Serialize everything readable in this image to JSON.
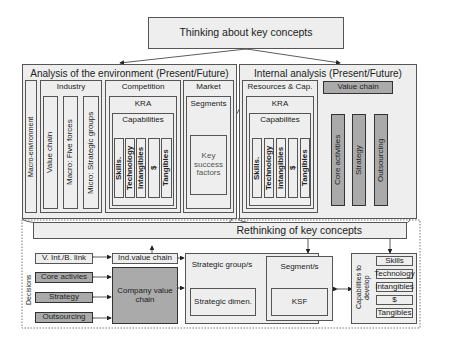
{
  "title": "Thinking about key concepts",
  "env": {
    "title": "Analysis of the environment (Present/Future)",
    "macro": "Macro-environment",
    "industry": "Industry",
    "industry_items": [
      "Value chain",
      "Macro: Five forces",
      "Micro: Strategic groups"
    ],
    "competition": "Competition",
    "kra": "KRA",
    "capabilities": "Capabilities",
    "cap_items": [
      "Skills.",
      "Technology",
      "Intangibles",
      "$",
      "Tangibles"
    ],
    "market": "Market",
    "segments": "Segments",
    "ksf": "Key success factors"
  },
  "internal": {
    "title": "Internal analysis (Present/Future)",
    "resources": "Resources & Cap.",
    "kra": "KRA",
    "capabilities": "Capabilites",
    "cap_items": [
      "Skills.",
      "Technology",
      "Intangibles",
      "$",
      "Tangibles"
    ],
    "value_chain": "Value chain",
    "vc_items": [
      "Core activities",
      "Strategy",
      "Outsourcing"
    ]
  },
  "rethink": {
    "title": "Rethinking of key concepts",
    "decisions": "Decisions",
    "left": [
      "V. Int./B. link",
      "Core activies",
      "Strategy",
      "Outsourcing"
    ],
    "ind_vc": "Ind.value chain",
    "company_vc": "Company value chain",
    "strategic_groups": "Strategic group/s",
    "strategic_dimen": "Strategic dimen.",
    "segments": "Segment/s",
    "ksf": "KSF",
    "cap_develop": "Capabilities to develop",
    "cap_items": [
      "Skills",
      "Technology",
      "Intangibles",
      "$",
      "Tangibles"
    ]
  }
}
